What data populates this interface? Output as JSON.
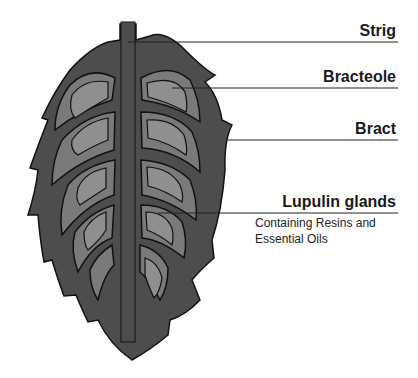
{
  "diagram": {
    "labels": [
      {
        "id": "strig",
        "text": "Strig"
      },
      {
        "id": "bracteole",
        "text": "Bracteole"
      },
      {
        "id": "bract",
        "text": "Bract"
      },
      {
        "id": "lupulin",
        "text": "Lupulin glands"
      }
    ],
    "lupulin_description": [
      "Containing Resins and",
      "Essential Oils"
    ],
    "colors": {
      "outer": "#4d4d4d",
      "inner": "#7a7a7a",
      "gland": "#8f8f8f",
      "outline": "#111111",
      "line": "#222222"
    }
  }
}
